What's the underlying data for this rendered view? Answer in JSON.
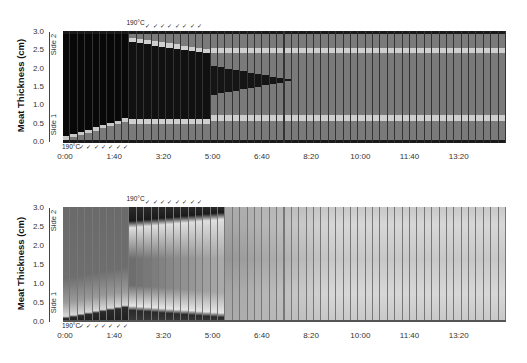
{
  "chart_data": [
    {
      "type": "heatmap",
      "title": "",
      "ylabel": "Meat Thickness (cm)",
      "xlabel": "",
      "ylim": [
        0.0,
        3.0
      ],
      "y_ticks": [
        "0.0",
        "0.5",
        "1.0",
        "1.5",
        "2.0",
        "2.5",
        "3.0"
      ],
      "x_ticks": [
        "0:00",
        "1:40",
        "3:20",
        "5:00",
        "6:40",
        "8:20",
        "10:00",
        "11:40",
        "13:20"
      ],
      "side_labels": {
        "bottom": "Side 1",
        "top": "Side 2"
      },
      "temperature_labels": {
        "side1": "190°C",
        "side2": "190°C"
      },
      "flip_marker": "✓",
      "n_columns": 60,
      "column_seconds": 15,
      "palette": "binary (black = uncooked, gray = cooked, light band = boundary)",
      "side1_heating_columns": [
        0,
        8
      ],
      "side2_heating_columns": [
        9,
        18
      ],
      "description": "Discrete cooked/uncooked state per time step; uncooked core (black) shrinks and vanishes near 11:20"
    },
    {
      "type": "heatmap",
      "title": "",
      "ylabel": "Meat Thickness (cm)",
      "xlabel": "",
      "ylim": [
        0.0,
        3.0
      ],
      "y_ticks": [
        "0.0",
        "0.5",
        "1.0",
        "1.5",
        "2.0",
        "2.5",
        "3.0"
      ],
      "x_ticks": [
        "0:00",
        "1:40",
        "3:20",
        "5:00",
        "6:40",
        "8:20",
        "10:00",
        "11:40",
        "13:20"
      ],
      "side_labels": {
        "bottom": "Side 1",
        "top": "Side 2"
      },
      "temperature_labels": {
        "side1": "190°C",
        "side2": "190°C"
      },
      "flip_marker": "✓",
      "n_columns": 60,
      "column_seconds": 15,
      "palette": "continuous grayscale temperature/doneness",
      "description": "Continuous gradient; heated surface dark, interior gray fading to uniform light gray after ~6:40"
    }
  ],
  "labels": {
    "ylabel": "Meat Thickness (cm)",
    "side1": "Side 1",
    "side2": "Side 2",
    "temp1": "190°C",
    "temp2": "190°C"
  }
}
